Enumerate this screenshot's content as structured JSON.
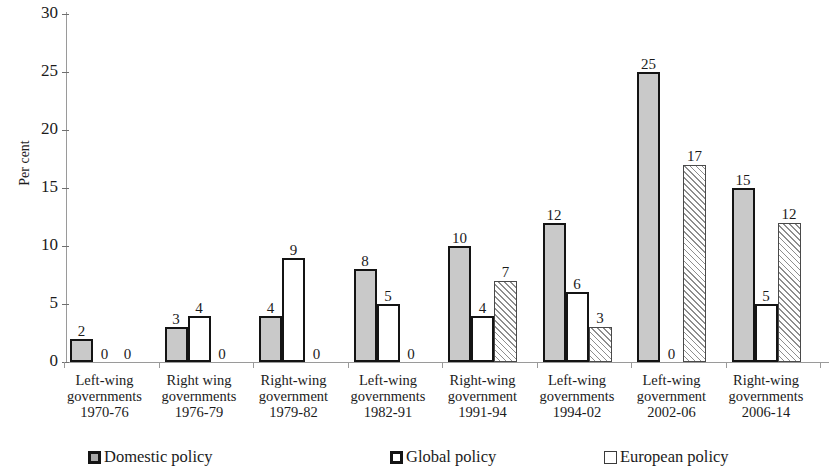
{
  "chart_data": {
    "type": "bar",
    "title": "",
    "xlabel": "",
    "ylabel": "Per cent",
    "ylim": [
      0,
      30
    ],
    "yticks": [
      0,
      5,
      10,
      15,
      20,
      25,
      30
    ],
    "grid": false,
    "legend_position": "bottom",
    "categories": [
      "Left-wing governments 1970-76",
      "Right wing governments 1976-79",
      "Right-wing government 1979-82",
      "Left-wing governments 1982-91",
      "Right-wing government 1991-94",
      "Left-wing governments 1994-02",
      "Left-wing government 2002-06",
      "Right-wing governments 2006-14"
    ],
    "category_lines": [
      [
        "Left-wing",
        "governments",
        "1970-76"
      ],
      [
        "Right wing",
        "governments",
        "1976-79"
      ],
      [
        "Right-wing",
        "government",
        "1979-82"
      ],
      [
        "Left-wing",
        "governments",
        "1982-91"
      ],
      [
        "Right-wing",
        "government",
        "1991-94"
      ],
      [
        "Left-wing",
        "governments",
        "1994-02"
      ],
      [
        "Left-wing",
        "government",
        "2002-06"
      ],
      [
        "Right-wing",
        "governments",
        "2006-14"
      ]
    ],
    "series": [
      {
        "name": "Domestic policy",
        "values": [
          2,
          3,
          4,
          8,
          10,
          12,
          25,
          15
        ]
      },
      {
        "name": "Global policy",
        "values": [
          0,
          4,
          9,
          5,
          4,
          6,
          0,
          5
        ]
      },
      {
        "name": "European policy",
        "values": [
          0,
          0,
          0,
          0,
          7,
          3,
          17,
          12
        ]
      }
    ]
  },
  "axis": {
    "y_title": "Per cent",
    "y_ticks": [
      "0",
      "5",
      "10",
      "15",
      "20",
      "25",
      "30"
    ]
  },
  "legend": {
    "items": [
      {
        "label": "Domestic policy",
        "swatch": "filled-gray-square-icon",
        "color": "#a8a8a8"
      },
      {
        "label": "Global policy",
        "swatch": "outlined-white-square-icon",
        "color": "#ffffff"
      },
      {
        "label": "European policy",
        "swatch": "outlined-light-square-icon",
        "color": "#ffffff"
      }
    ]
  },
  "colors": {
    "domestic_fill": "#c9c9c9",
    "global_fill": "#ffffff",
    "european_fill": "#fdfdfd",
    "bar_outline": "#141414",
    "axis": "#9a9a9a",
    "text": "#1b1b1b"
  }
}
